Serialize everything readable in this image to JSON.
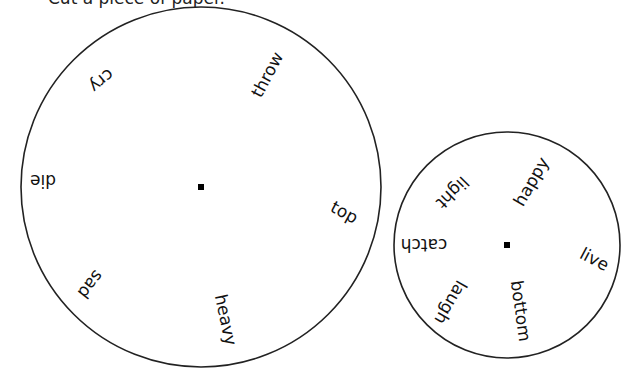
{
  "instruction_partial": "Cut a piece of paper.",
  "wheels": [
    {
      "name": "large-wheel",
      "center": [
        201,
        187
      ],
      "radius": 180,
      "words": [
        {
          "text": "throw",
          "x": 268,
          "y": 75,
          "rotate": -62
        },
        {
          "text": "cry",
          "x": 101,
          "y": 80,
          "rotate": 140
        },
        {
          "text": "die",
          "x": 43,
          "y": 180,
          "rotate": 180
        },
        {
          "text": "top",
          "x": 344,
          "y": 213,
          "rotate": 28
        },
        {
          "text": "sad",
          "x": 90,
          "y": 284,
          "rotate": 128
        },
        {
          "text": "heavy",
          "x": 225,
          "y": 320,
          "rotate": 78
        }
      ]
    },
    {
      "name": "small-wheel",
      "center": [
        507,
        245
      ],
      "radius": 113,
      "words": [
        {
          "text": "happy",
          "x": 532,
          "y": 182,
          "rotate": -60
        },
        {
          "text": "light",
          "x": 452,
          "y": 192,
          "rotate": 135
        },
        {
          "text": "catch",
          "x": 424,
          "y": 244,
          "rotate": 180
        },
        {
          "text": "live",
          "x": 594,
          "y": 260,
          "rotate": 28
        },
        {
          "text": "laugh",
          "x": 450,
          "y": 302,
          "rotate": 120
        },
        {
          "text": "bottom",
          "x": 520,
          "y": 311,
          "rotate": 82
        }
      ]
    }
  ],
  "colors": {
    "stroke": "#222222",
    "text": "#111111",
    "background": "#ffffff"
  }
}
